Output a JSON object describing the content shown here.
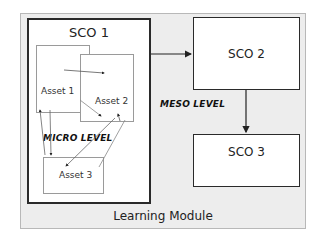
{
  "diagram": {
    "container_label": "Learning Module",
    "meso_level_label": "MESO LEVEL",
    "micro_level_label": "MICRO LEVEL",
    "scos": [
      {
        "id": "sco1",
        "label": "SCO 1"
      },
      {
        "id": "sco2",
        "label": "SCO 2"
      },
      {
        "id": "sco3",
        "label": "SCO 3"
      }
    ],
    "assets": [
      {
        "id": "asset1",
        "label": "Asset 1"
      },
      {
        "id": "asset2",
        "label": "Asset 2"
      },
      {
        "id": "asset3",
        "label": "Asset 3"
      }
    ],
    "edges": [
      {
        "from": "SCO 1",
        "to": "SCO 2"
      },
      {
        "from": "SCO 2",
        "to": "SCO 3"
      },
      {
        "from": "Asset 1",
        "to": "Asset 2"
      },
      {
        "from": "Asset 1",
        "to": "Asset 2 (lower)"
      },
      {
        "from": "Asset 3",
        "to": "Asset 1"
      },
      {
        "from": "Asset 1",
        "to": "Asset 3"
      },
      {
        "from": "Asset 3",
        "to": "Asset 2"
      },
      {
        "from": "Asset 2",
        "to": "Asset 3"
      }
    ],
    "colors": {
      "background": "#ededed",
      "box_fill": "#ffffff",
      "sco_border": "#2a2a2a",
      "asset_border": "#9a9a9a"
    }
  }
}
